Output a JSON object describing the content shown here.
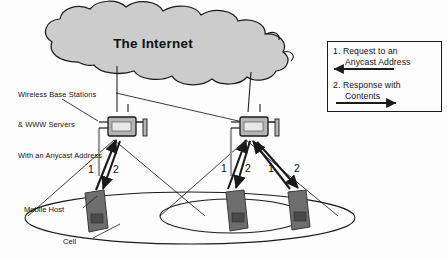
{
  "diagram": {
    "cloud": {
      "label": "The Internet"
    },
    "annotation": {
      "line1": "Wireless Base Stations",
      "line2": "& WWW Servers",
      "line3": "With an Anycast Address"
    },
    "labels": {
      "mobile_host": "Mobile Host",
      "cell": "Cell"
    },
    "legend": {
      "item1_number": "1.",
      "item1_line1": "Request to an",
      "item1_line2": "Anycast Address",
      "item1_arrow_direction": "left",
      "item2_number": "2.",
      "item2_line1": "Response with",
      "item2_line2": "Contents",
      "item2_arrow_direction": "right"
    },
    "flow_labels": {
      "left_up": "1",
      "left_down": "2",
      "mid_up": "1",
      "mid_down": "2",
      "right_up": "1",
      "right_down": "2"
    },
    "colors": {
      "cloud_fill": "#cccccc",
      "stroke": "#1a1a1a",
      "base_station_fill": "#b5b5b5",
      "handset_fill": "#6e6e6e",
      "background": "#fdfdfd"
    },
    "counts": {
      "base_stations": 2,
      "mobile_hosts": 3,
      "cells": 2
    }
  }
}
